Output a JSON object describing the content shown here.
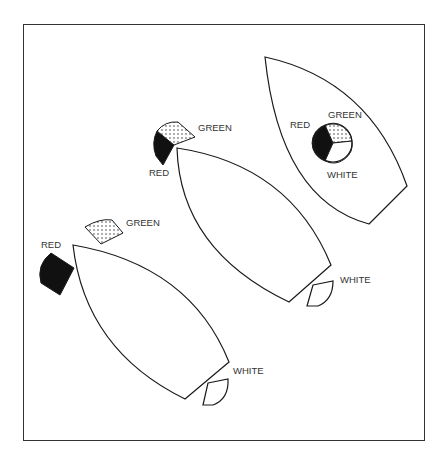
{
  "figure": {
    "frame": {
      "stroke": "#333333",
      "background": "#ffffff"
    },
    "colors": {
      "red_fill": "#111111",
      "green_pattern": "dotted",
      "white_fill": "#ffffff",
      "outline": "#1a1a1a"
    }
  },
  "vessels": [
    {
      "id": "vessel-bottom-left",
      "lights": {
        "red": {
          "label": "RED"
        },
        "green": {
          "label": "GREEN"
        },
        "white": {
          "label": "WHITE"
        }
      }
    },
    {
      "id": "vessel-middle",
      "lights": {
        "red": {
          "label": "RED"
        },
        "green": {
          "label": "GREEN"
        },
        "white": {
          "label": "WHITE"
        }
      }
    },
    {
      "id": "vessel-top-right",
      "lights": {
        "red": {
          "label": "RED"
        },
        "green": {
          "label": "GREEN"
        },
        "white": {
          "label": "WHITE"
        }
      }
    }
  ]
}
